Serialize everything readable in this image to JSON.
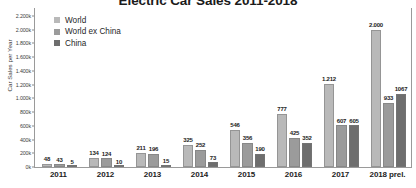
{
  "chart_data": {
    "type": "bar",
    "title": "Electric Car Sales 2011-2018",
    "xlabel": "",
    "ylabel": "Car Sales per Year",
    "categories": [
      "2011",
      "2012",
      "2013",
      "2014",
      "2015",
      "2016",
      "2017",
      "2018 prel."
    ],
    "ylim": [
      0,
      2300
    ],
    "ytick_values": [
      0,
      200,
      400,
      600,
      800,
      1000,
      1200,
      1400,
      1600,
      1800,
      2000,
      2200
    ],
    "ytick_labels": [
      "0k",
      "200k",
      "400k",
      "600k",
      "800k",
      "1.000k",
      "1.200k",
      "1.400k",
      "1.600k",
      "1.800k",
      "2.000k",
      "2.200k"
    ],
    "grid": false,
    "legend_position": "top-left",
    "series": [
      {
        "name": "World",
        "color": "#b9b9b9",
        "values": [
          48,
          134,
          211,
          325,
          546,
          777,
          1212,
          2000
        ],
        "labels": [
          "48",
          "134",
          "211",
          "325",
          "546",
          "777",
          "1.212",
          "2.000"
        ]
      },
      {
        "name": "World ex China",
        "color": "#9b9b9b",
        "values": [
          43,
          124,
          196,
          252,
          356,
          425,
          607,
          933
        ],
        "labels": [
          "43",
          "124",
          "196",
          "252",
          "356",
          "425",
          "607",
          "933"
        ]
      },
      {
        "name": "China",
        "color": "#6e6e6e",
        "values": [
          5,
          10,
          15,
          73,
          190,
          352,
          605,
          1067
        ],
        "labels": [
          "5",
          "10",
          "15",
          "73",
          "190",
          "352",
          "605",
          "1067"
        ]
      }
    ]
  },
  "colors": {
    "series_world": "#b9b9b9",
    "series_world_ex_china": "#9b9b9b",
    "series_china": "#6e6e6e",
    "axis": "#9a9a9a",
    "text": "#1c1c1c",
    "background": "#ffffff"
  }
}
